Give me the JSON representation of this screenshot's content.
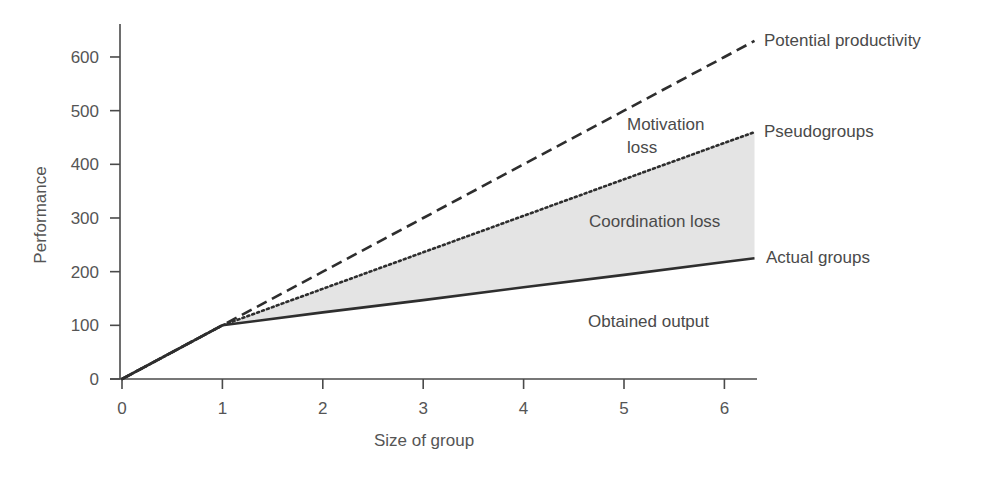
{
  "chart_data": {
    "type": "line",
    "title": "",
    "xlabel": "Size of group",
    "ylabel": "Performance",
    "xlim": [
      0,
      6.32
    ],
    "ylim": [
      0,
      660
    ],
    "grid": false,
    "legend": "direct labels at line ends (right)",
    "x_ticks": [
      0,
      1,
      2,
      3,
      4,
      5,
      6
    ],
    "y_ticks": [
      0,
      100,
      200,
      300,
      400,
      500,
      600
    ],
    "x": [
      0,
      1,
      2,
      3,
      4,
      5,
      6,
      6.3
    ],
    "series": [
      {
        "name": "Potential productivity",
        "style": "dashed",
        "values": [
          0,
          100,
          200,
          300,
          400,
          500,
          600,
          630
        ]
      },
      {
        "name": "Pseudogroups",
        "style": "dotted",
        "values": [
          0,
          100,
          168,
          236,
          304,
          372,
          440,
          460
        ]
      },
      {
        "name": "Actual groups",
        "style": "solid",
        "values": [
          0,
          100,
          124,
          147,
          171,
          194,
          218,
          225
        ]
      }
    ],
    "shaded_region": {
      "between": [
        "Pseudogroups",
        "Actual groups"
      ],
      "x_range": [
        1,
        6.3
      ],
      "color": "#e4e4e4"
    },
    "annotations": [
      {
        "text": "Motivation loss",
        "lines": [
          "Motivation",
          "loss"
        ],
        "region": "between Potential productivity and Pseudogroups"
      },
      {
        "text": "Coordination loss",
        "region": "between Pseudogroups and Actual groups (shaded)"
      },
      {
        "text": "Obtained output",
        "region": "below Actual groups"
      }
    ]
  },
  "labels": {
    "xlabel": "Size of group",
    "ylabel": "Performance",
    "x_ticks": [
      "0",
      "1",
      "2",
      "3",
      "4",
      "5",
      "6"
    ],
    "y_ticks": [
      "0",
      "100",
      "200",
      "300",
      "400",
      "500",
      "600"
    ],
    "series": [
      "Potential productivity",
      "Pseudogroups",
      "Actual groups"
    ],
    "motivation_1": "Motivation",
    "motivation_2": "loss",
    "coordination": "Coordination loss",
    "obtained": "Obtained output"
  },
  "colors": {
    "line": "#2e2e2e",
    "axis": "#4a4a4a",
    "shade": "#e4e4e4",
    "text": "#555555"
  }
}
